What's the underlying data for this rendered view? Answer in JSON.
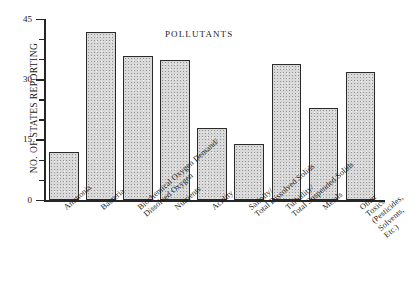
{
  "chart_data": {
    "type": "bar",
    "title": "POLLUTANTS",
    "xlabel": "",
    "ylabel": "NO. OF STATES REPORTING",
    "ylim": [
      0,
      45
    ],
    "ytick_major": [
      0,
      15,
      30,
      45
    ],
    "ytick_minor": [
      5,
      10,
      20,
      25,
      35,
      40
    ],
    "grid": false,
    "legend": null,
    "categories": [
      "Ammonia",
      "Bacteria",
      "Biochemical Oxygen Demand/\nDissolved Oxygen",
      "Nutrients",
      "Acidity",
      "Salinity/\nTotal Dissolved Solids",
      "Turbidity/\nTotal Suspended Solids",
      "Metals",
      "Other Toxics\n(Pesticides, Solvents, Etc.)"
    ],
    "values": [
      12,
      42,
      36,
      35,
      18,
      14,
      34,
      23,
      32
    ],
    "bar_fill": "#d9d9d9",
    "bar_edge": "#2a2a2a"
  },
  "axis": {
    "y_title": "NO. OF STATES REPORTING",
    "tick_labels": [
      "45",
      "30",
      "15",
      "0"
    ]
  }
}
